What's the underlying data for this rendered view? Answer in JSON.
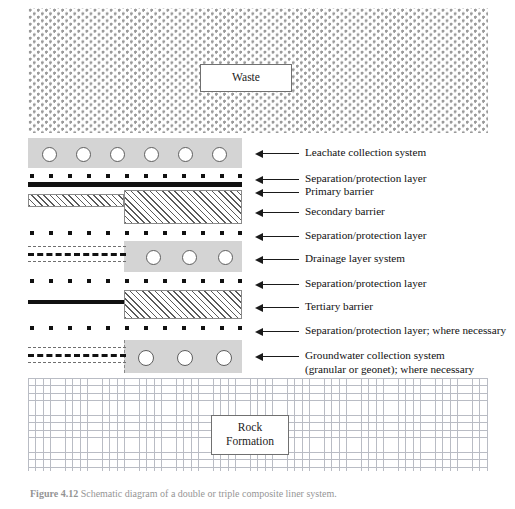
{
  "figure": {
    "waste_label": "Waste",
    "rock_label_line1": "Rock",
    "rock_label_line2": "Formation",
    "caption_bold": "Figure 4.12",
    "caption_rest": "   Schematic diagram of a double or triple composite liner system."
  },
  "colors": {
    "granular": "#d4d4d4",
    "geomembrane": "#111111",
    "clay_hatch": "#5a5a5a",
    "rock_grid": "#b9bcc4",
    "waste_stipple": "#9a9a9a",
    "text": "#111111"
  },
  "callouts": [
    {
      "id": "leachate-collection-system",
      "text": "Leachate collection system"
    },
    {
      "id": "separation-protection-1",
      "text": "Separation/protection layer"
    },
    {
      "id": "primary-barrier",
      "text": "Primary barrier"
    },
    {
      "id": "secondary-barrier",
      "text": "Secondary barrier"
    },
    {
      "id": "separation-protection-2",
      "text": "Separation/protection layer"
    },
    {
      "id": "drainage-layer-system",
      "text": "Drainage layer system"
    },
    {
      "id": "separation-protection-3",
      "text": "Separation/protection layer"
    },
    {
      "id": "tertiary-barrier",
      "text": "Tertiary barrier"
    },
    {
      "id": "separation-protection-4",
      "text": "Separation/protection layer; where necessary"
    },
    {
      "id": "groundwater-collection-system",
      "text": "Groundwater collection system\n(granular or geonet); where necessary"
    }
  ],
  "layers": {
    "waste": {
      "name": "Waste",
      "pattern": "stipple"
    },
    "leachate_collection": {
      "name": "Leachate collection system",
      "pattern": "granular",
      "pipe_count": 6
    },
    "separation_1": {
      "name": "Separation/protection layer",
      "pattern": "geotextile-dots",
      "dot_count": 12
    },
    "primary_barrier": {
      "name": "Primary barrier",
      "pattern": "geomembrane"
    },
    "secondary_barrier": {
      "name": "Secondary barrier",
      "pattern": "geomembrane-plus-clay"
    },
    "separation_2": {
      "name": "Separation/protection layer",
      "pattern": "geotextile-dots",
      "dot_count": 12
    },
    "drainage_layer": {
      "name": "Drainage layer system",
      "pattern": "geonet-plus-granular",
      "pipe_count": 3
    },
    "separation_3": {
      "name": "Separation/protection layer",
      "pattern": "geotextile-dots",
      "dot_count": 12
    },
    "tertiary_barrier": {
      "name": "Tertiary barrier",
      "pattern": "geomembrane-plus-clay"
    },
    "separation_4": {
      "name": "Separation/protection layer; where necessary",
      "pattern": "geotextile-dots",
      "dot_count": 12
    },
    "groundwater_collection": {
      "name": "Groundwater collection system (granular or geonet); where necessary",
      "pattern": "geonet-plus-granular",
      "pipe_count": 3
    },
    "rock_formation": {
      "name": "Rock Formation",
      "pattern": "cross-grid"
    }
  }
}
